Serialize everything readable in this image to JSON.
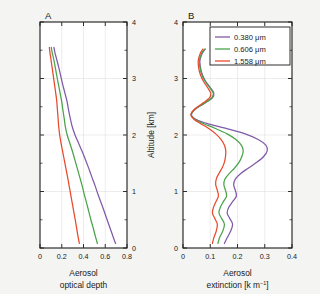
{
  "figure": {
    "background": "#f4f4f2",
    "panel_background": "#ffffff"
  },
  "series_colors": {
    "s1": "#7f5aa8",
    "s2": "#4aa34a",
    "s3": "#e8492b"
  },
  "legend": {
    "position": "top-right-panel-B",
    "entries": [
      {
        "label": "0.380 μm",
        "color": "#7f5aa8"
      },
      {
        "label": "0.606 μm",
        "color": "#4aa34a"
      },
      {
        "label": "1.558 μm",
        "color": "#e8492b"
      }
    ]
  },
  "shared_axis": {
    "ylabel": "Altitude [km]",
    "ylim": [
      0,
      4
    ],
    "yticks": [
      0,
      1,
      2,
      3,
      4
    ],
    "yticklabels": [
      "0",
      "1",
      "2",
      "3",
      "4"
    ],
    "yminor": [
      0.5,
      1.5,
      2.5,
      3.5
    ]
  },
  "chart_data": [
    {
      "type": "line",
      "panel": "A",
      "panel_label": "A",
      "title": "",
      "xlabel_line1": "Aerosol",
      "xlabel_line2": "optical depth",
      "ylabel": "Altitude [km]",
      "xlim": [
        0,
        0.8
      ],
      "ylim": [
        0,
        4
      ],
      "xticks": [
        0,
        0.2,
        0.4,
        0.6,
        0.8
      ],
      "xticklabels": [
        "0",
        "0.2",
        "0.4",
        "0.6",
        "0.8"
      ],
      "yticks": [
        0,
        1,
        2,
        3,
        4
      ],
      "yticklabels": [
        "0",
        "1",
        "2",
        "3",
        "4"
      ],
      "grid": true,
      "legend_shown": false,
      "orientation": "x-is-value, y-is-altitude",
      "y_altitude_km": [
        0.08,
        0.2,
        0.35,
        0.5,
        0.65,
        0.8,
        0.95,
        1.1,
        1.25,
        1.4,
        1.55,
        1.7,
        1.85,
        2.0,
        2.15,
        2.3,
        2.45,
        2.6,
        2.75,
        2.9,
        3.05,
        3.2,
        3.35,
        3.45,
        3.55
      ],
      "series": [
        {
          "name": "0.380 μm",
          "color": "#7f5aa8",
          "values": [
            0.695,
            0.672,
            0.645,
            0.617,
            0.59,
            0.562,
            0.533,
            0.507,
            0.478,
            0.45,
            0.421,
            0.39,
            0.356,
            0.322,
            0.296,
            0.278,
            0.262,
            0.248,
            0.228,
            0.208,
            0.19,
            0.172,
            0.152,
            0.138,
            0.128
          ]
        },
        {
          "name": "0.606 μm",
          "color": "#4aa34a",
          "values": [
            0.528,
            0.51,
            0.49,
            0.468,
            0.448,
            0.428,
            0.407,
            0.388,
            0.366,
            0.344,
            0.322,
            0.3,
            0.275,
            0.25,
            0.233,
            0.222,
            0.21,
            0.199,
            0.184,
            0.169,
            0.154,
            0.14,
            0.125,
            0.113,
            0.104
          ]
        },
        {
          "name": "1.558 μm",
          "color": "#e8492b",
          "values": [
            0.362,
            0.35,
            0.337,
            0.324,
            0.31,
            0.296,
            0.282,
            0.268,
            0.254,
            0.239,
            0.224,
            0.209,
            0.194,
            0.181,
            0.172,
            0.166,
            0.16,
            0.154,
            0.144,
            0.133,
            0.122,
            0.111,
            0.1,
            0.092,
            0.086
          ]
        }
      ]
    },
    {
      "type": "line",
      "panel": "B",
      "panel_label": "B",
      "title": "",
      "xlabel_line1": "Aerosol",
      "xlabel_line2": "extinction [k m",
      "xlabel_line2_sup": "−1",
      "xlabel_line2_end": "]",
      "ylabel": "Altitude [km]",
      "xlim": [
        0,
        0.4
      ],
      "ylim": [
        0,
        4
      ],
      "xticks": [
        0,
        0.1,
        0.2,
        0.3,
        0.4
      ],
      "xticklabels": [
        "0",
        "0.1",
        "0.2",
        "0.3",
        "0.4"
      ],
      "yticks": [
        0,
        1,
        2,
        3,
        4
      ],
      "yticklabels": [
        "0",
        "1",
        "2",
        "3",
        "4"
      ],
      "grid": true,
      "legend_shown": true,
      "orientation": "x-is-value, y-is-altitude",
      "y_altitude_km": [
        0.08,
        0.18,
        0.3,
        0.42,
        0.52,
        0.62,
        0.72,
        0.82,
        0.92,
        1.02,
        1.12,
        1.22,
        1.32,
        1.42,
        1.52,
        1.62,
        1.72,
        1.82,
        1.92,
        2.02,
        2.12,
        2.2,
        2.28,
        2.36,
        2.46,
        2.56,
        2.66,
        2.74,
        2.84,
        2.96,
        3.08,
        3.2,
        3.32,
        3.44,
        3.52
      ],
      "series": [
        {
          "name": "0.380 μm",
          "color": "#7f5aa8",
          "values": [
            0.152,
            0.162,
            0.175,
            0.182,
            0.172,
            0.162,
            0.168,
            0.182,
            0.196,
            0.192,
            0.186,
            0.192,
            0.212,
            0.242,
            0.272,
            0.296,
            0.309,
            0.304,
            0.276,
            0.228,
            0.155,
            0.09,
            0.047,
            0.031,
            0.046,
            0.078,
            0.108,
            0.113,
            0.1,
            0.082,
            0.07,
            0.064,
            0.062,
            0.07,
            0.082
          ]
        },
        {
          "name": "0.606 μm",
          "color": "#4aa34a",
          "values": [
            0.128,
            0.134,
            0.146,
            0.152,
            0.142,
            0.132,
            0.137,
            0.148,
            0.16,
            0.156,
            0.15,
            0.154,
            0.17,
            0.19,
            0.206,
            0.216,
            0.221,
            0.214,
            0.194,
            0.162,
            0.117,
            0.076,
            0.043,
            0.03,
            0.045,
            0.077,
            0.106,
            0.111,
            0.098,
            0.08,
            0.068,
            0.062,
            0.06,
            0.068,
            0.079
          ]
        },
        {
          "name": "1.558 μm",
          "color": "#e8492b",
          "values": [
            0.108,
            0.113,
            0.122,
            0.126,
            0.117,
            0.108,
            0.112,
            0.121,
            0.13,
            0.126,
            0.12,
            0.122,
            0.132,
            0.144,
            0.152,
            0.156,
            0.157,
            0.152,
            0.14,
            0.12,
            0.093,
            0.065,
            0.04,
            0.029,
            0.043,
            0.072,
            0.098,
            0.102,
            0.09,
            0.074,
            0.063,
            0.057,
            0.056,
            0.063,
            0.073
          ]
        }
      ]
    }
  ]
}
